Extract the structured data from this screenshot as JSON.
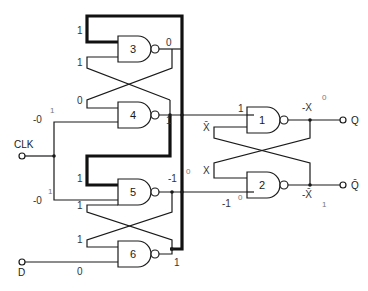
{
  "diagram": {
    "type": "edge-triggered D flip-flop (six NAND gates)",
    "gates": [
      {
        "id": "3",
        "label": "3",
        "output_level": "0",
        "inputs": [
          "1",
          "1"
        ]
      },
      {
        "id": "4",
        "label": "4",
        "output_level": "1",
        "inputs": [
          "0",
          "-0→1"
        ]
      },
      {
        "id": "5",
        "label": "5",
        "output_level": "-1→0",
        "inputs": [
          "1",
          "1"
        ],
        "clk_input": "-0→1"
      },
      {
        "id": "6",
        "label": "6",
        "output_level": "1",
        "inputs": [
          "1",
          "0"
        ]
      },
      {
        "id": "1",
        "label": "1",
        "output_level": "-X→0",
        "inputs": [
          "1",
          "X̄"
        ]
      },
      {
        "id": "2",
        "label": "2",
        "output_level": "-X̄→1",
        "inputs": [
          "X",
          "-1→0"
        ]
      }
    ],
    "terminals": {
      "clk": "CLK",
      "d": "D",
      "q": "Q",
      "q_bar": "Q̄"
    },
    "labels": {
      "g3_in_top": "1",
      "g3_in_bottom": "1",
      "g3_out": "0",
      "g4_in_top": "0",
      "g4_in_clk": "-0",
      "g4_in_clk_arrow": "1",
      "g4_out": "1",
      "g5_in_top": "1",
      "g5_in_bottom": "1",
      "g5_in_clk": "-0",
      "g5_in_clk_arrow": "1",
      "g5_out": "-1",
      "g5_out_arrow": "0",
      "g6_in_top": "1",
      "g6_in_d": "0",
      "g6_out": "1",
      "g1_in_top": "1",
      "g1_in_bottom": "X̄",
      "g1_out": "-X",
      "g1_out_arrow": "0",
      "g2_in_top": "X",
      "g2_in_bottom": "-1",
      "g2_in_bottom_arrow": "0",
      "g2_out": "-X̄",
      "g2_out_arrow": "1"
    }
  }
}
